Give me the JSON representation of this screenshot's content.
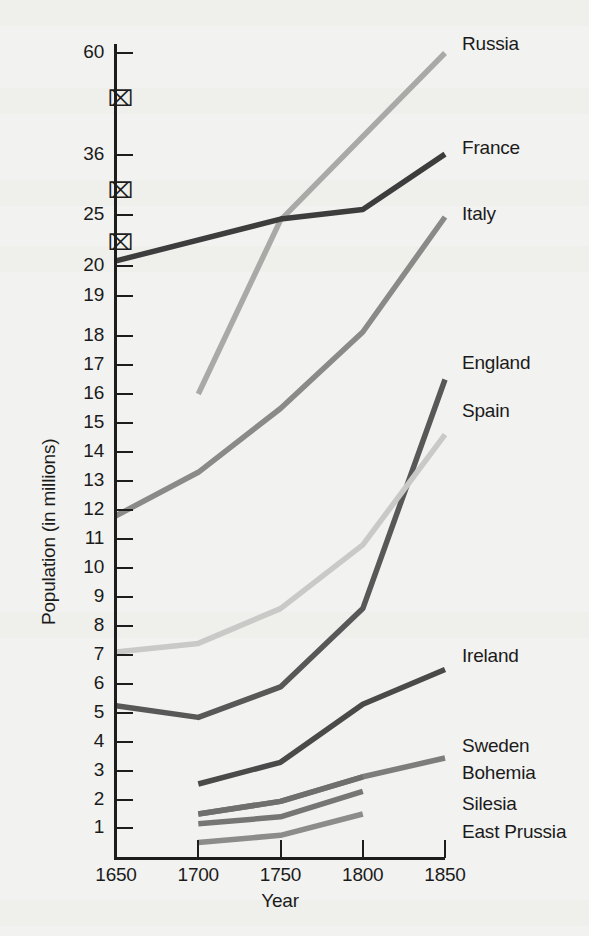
{
  "chart_data": {
    "type": "line",
    "title": "",
    "subtitle": "",
    "xlabel": "Year",
    "ylabel": "Population (in millions)",
    "x": [
      1650,
      1700,
      1750,
      1800,
      1850
    ],
    "xlim": [
      1650,
      1850
    ],
    "xticks": [
      "1650",
      "1700",
      "1750",
      "1800",
      "1850"
    ],
    "yticks": [
      "60",
      "36",
      "25",
      "20",
      "19",
      "18",
      "17",
      "16",
      "15",
      "14",
      "13",
      "12",
      "11",
      "10",
      "9",
      "8",
      "7",
      "6",
      "5",
      "4",
      "3",
      "2",
      "1"
    ],
    "grid": false,
    "legend_position": "right-inline",
    "axis_breaks": [
      {
        "between": "20 and 25"
      },
      {
        "between": "25 and 36"
      },
      {
        "between": "36 and 60"
      }
    ],
    "series": [
      {
        "name": "Russia",
        "color": "#a9a9a7",
        "x": [
          1700,
          1750,
          1850
        ],
        "values": [
          16.0,
          24.5,
          60.0
        ]
      },
      {
        "name": "France",
        "color": "#3d3d3d",
        "x": [
          1650,
          1750,
          1800,
          1850
        ],
        "values": [
          20.5,
          24.6,
          26.0,
          36.2
        ]
      },
      {
        "name": "Italy",
        "color": "#8a8a88",
        "x": [
          1650,
          1700,
          1750,
          1800,
          1850
        ],
        "values": [
          11.8,
          13.3,
          15.5,
          18.1,
          24.8
        ]
      },
      {
        "name": "England",
        "color": "#585858",
        "x": [
          1650,
          1700,
          1750,
          1800,
          1850
        ],
        "values": [
          5.25,
          4.85,
          5.9,
          8.6,
          16.5
        ]
      },
      {
        "name": "Spain",
        "color": "#c9c9c7",
        "x": [
          1650,
          1700,
          1750,
          1800,
          1850
        ],
        "values": [
          7.1,
          7.4,
          8.6,
          10.8,
          14.6
        ]
      },
      {
        "name": "Ireland",
        "color": "#4a4a4a",
        "x": [
          1700,
          1750,
          1800,
          1850
        ],
        "values": [
          2.55,
          3.3,
          5.3,
          6.5
        ]
      },
      {
        "name": "Sweden",
        "color": "#7d7d7b",
        "x": [
          1700,
          1750,
          1800,
          1850
        ],
        "values": [
          1.5,
          1.95,
          2.8,
          3.45
        ]
      },
      {
        "name": "Bohemia",
        "color": "#6f6f6d",
        "x": [
          1700,
          1750,
          1800
        ],
        "values": [
          1.5,
          1.95,
          2.8
        ]
      },
      {
        "name": "Silesia",
        "color": "#767674",
        "x": [
          1700,
          1750,
          1800
        ],
        "values": [
          1.15,
          1.4,
          2.3
        ]
      },
      {
        "name": "East Prussia",
        "color": "#8c8c8a",
        "x": [
          1700,
          1750,
          1800
        ],
        "values": [
          0.5,
          0.75,
          1.5
        ]
      }
    ],
    "series_labels": [
      {
        "name": "Russia",
        "label": "Russia"
      },
      {
        "name": "France",
        "label": "France"
      },
      {
        "name": "Italy",
        "label": "Italy"
      },
      {
        "name": "England",
        "label": "England"
      },
      {
        "name": "Spain",
        "label": "Spain"
      },
      {
        "name": "Ireland",
        "label": "Ireland"
      },
      {
        "name": "Sweden",
        "label": "Sweden"
      },
      {
        "name": "Bohemia",
        "label": "Bohemia"
      },
      {
        "name": "Silesia",
        "label": "Silesia"
      },
      {
        "name": "East Prussia",
        "label": "East Prussia"
      }
    ]
  },
  "axis": {
    "y_title": "Population (in millions)",
    "x_title": "Year"
  },
  "colors": {
    "ink": "#1d1d1d",
    "paper": "#f2f2f0"
  }
}
